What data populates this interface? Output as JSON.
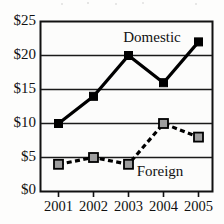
{
  "chart_data": {
    "type": "line",
    "title": "",
    "subtitle": "",
    "xlabel": "",
    "ylabel": "",
    "categories": [
      "2001",
      "2002",
      "2003",
      "2004",
      "2005"
    ],
    "x_tick_labels": [
      "2001",
      "2002",
      "2003",
      "2004",
      "2005"
    ],
    "y_tick_labels": [
      "$0",
      "$5",
      "$10",
      "$15",
      "$20",
      "$25"
    ],
    "y_tick_values": [
      0,
      5,
      10,
      15,
      20,
      25
    ],
    "ylim": [
      0,
      25
    ],
    "grid": "horizontal",
    "legend_position": "inline-annotations",
    "series": [
      {
        "name": "Domestic",
        "values": [
          10,
          14,
          20,
          16,
          22
        ],
        "line_style": "solid",
        "marker": "square",
        "marker_fill": "#000000",
        "line_color": "#000000",
        "annotation": "Domestic"
      },
      {
        "name": "Foreign",
        "values": [
          4,
          5,
          4,
          10,
          8
        ],
        "line_style": "dashed",
        "marker": "square",
        "marker_fill": "#9e9e9e",
        "line_color": "#000000",
        "annotation": "Foreign"
      }
    ],
    "annotations": [
      {
        "text": "Domestic",
        "series": "Domestic"
      },
      {
        "text": "Foreign",
        "series": "Foreign"
      }
    ],
    "colors": {
      "background": "#fdfdfc",
      "plot_background": "#fcfcfb",
      "axis": "#111111",
      "gridline": "#1a1a1a",
      "domestic_marker": "#000000",
      "foreign_marker": "#9e9e9e"
    }
  }
}
